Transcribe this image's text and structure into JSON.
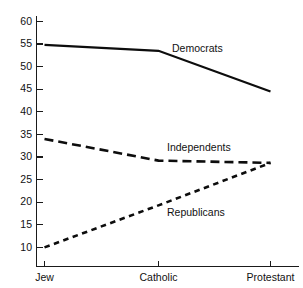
{
  "chart_data": {
    "type": "line",
    "title": "",
    "subtitle": "",
    "xlabel": "",
    "ylabel": "",
    "categories": [
      "Jew",
      "Catholic",
      "Protestant"
    ],
    "series": [
      {
        "name": "Democrats",
        "values": [
          54.8,
          53.5,
          44.5
        ],
        "style": "solid",
        "label": "Democrats",
        "label_x": 172,
        "label_y": 52
      },
      {
        "name": "Independents",
        "values": [
          34.0,
          29.2,
          28.7
        ],
        "style": "long-dash",
        "label": "Independents",
        "label_x": 167,
        "label_y": 151
      },
      {
        "name": "Republicans",
        "values": [
          10.0,
          19.3,
          28.7
        ],
        "style": "short-dash",
        "label": "Republicans",
        "label_x": 167,
        "label_y": 216
      }
    ],
    "yticks": [
      60,
      55,
      50,
      45,
      40,
      35,
      30,
      25,
      20,
      15,
      10
    ],
    "ytick_labels": [
      "60",
      "55",
      "50",
      "45",
      "40",
      "35",
      "30",
      "25",
      "20",
      "15",
      "10"
    ],
    "ylim": [
      5.5,
      62
    ],
    "grid": false,
    "legend": "inline-labels",
    "colors": {
      "line": "#0d0d0d",
      "axis": "#1a1a1a",
      "text": "#111111",
      "background": "#ffffff"
    }
  },
  "axis": {
    "y_tick_values": [
      "60",
      "55",
      "50",
      "45",
      "40",
      "35",
      "30",
      "25",
      "20",
      "15",
      "10"
    ],
    "x_tick_values": [
      "Jew",
      "Catholic",
      "Protestant"
    ]
  }
}
